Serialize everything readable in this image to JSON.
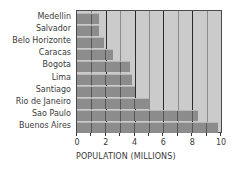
{
  "chart_data": {
    "type": "bar",
    "orientation": "horizontal",
    "title": "",
    "categories": [
      "Medellin",
      "Salvador",
      "Belo Horizonte",
      "Caracas",
      "Bogota",
      "Lima",
      "Santiago",
      "Rio de Janeiro",
      "Sao Paulo",
      "Buenos Aires"
    ],
    "values": [
      1.5,
      1.5,
      1.9,
      2.5,
      3.7,
      3.8,
      4.0,
      5.0,
      8.4,
      9.8
    ],
    "xlabel": "POPULATION (MILLIONS)",
    "ylabel": "",
    "xlim": [
      0,
      10
    ],
    "xticks": [
      0,
      2,
      4,
      6,
      8,
      10
    ],
    "grid": true,
    "legend": null,
    "colors": {
      "bar": "#8c8c8c",
      "background": "#cbcbcb",
      "grid_major": "#2a2a2a",
      "grid_minor": "#8a8a8a"
    }
  }
}
